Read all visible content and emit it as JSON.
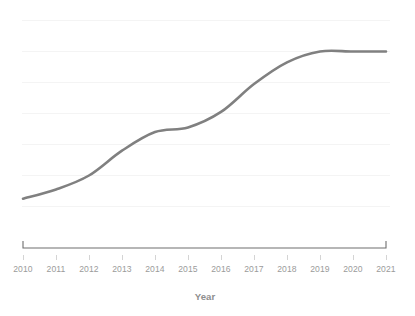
{
  "chart_data": {
    "type": "line",
    "title": "",
    "subtitle": "",
    "xlabel": "Year",
    "ylabel": "",
    "grid": "horizontal",
    "legend": "none",
    "categories": [
      "2010",
      "2011",
      "2012",
      "2013",
      "2014",
      "2015",
      "2016",
      "2017",
      "2018",
      "2019",
      "2020",
      "2021"
    ],
    "x": [
      2010,
      2011,
      2012,
      2013,
      2014,
      2015,
      2016,
      2017,
      2018,
      2019,
      2020,
      2021
    ],
    "values": [
      0.25,
      0.55,
      1.0,
      1.8,
      2.4,
      2.55,
      3.05,
      3.95,
      4.65,
      5.0,
      5.0,
      5.0
    ],
    "series": [
      {
        "name": "series-1",
        "color": "#808080",
        "values": [
          0.25,
          0.55,
          1.0,
          1.8,
          2.4,
          2.55,
          3.05,
          3.95,
          4.65,
          5.0,
          5.0,
          5.0
        ]
      }
    ],
    "xlim": [
      2010,
      2021
    ],
    "ylim": [
      0,
      6
    ],
    "y_gridline_values": [
      0,
      1,
      2,
      3,
      4,
      5,
      6
    ],
    "y_tick_labels": [],
    "annotations": []
  },
  "axis": {
    "x_title": "Year",
    "x_tick_labels": [
      "2010",
      "2011",
      "2012",
      "2013",
      "2014",
      "2015",
      "2016",
      "2017",
      "2018",
      "2019",
      "2020",
      "2021"
    ]
  },
  "colors": {
    "line": "#808080",
    "gridline": "#f4f4f4",
    "axis": "#6e6e6e",
    "tick_label": "#9b9b9b",
    "axis_title": "#8e8e8e",
    "background": "#ffffff"
  }
}
